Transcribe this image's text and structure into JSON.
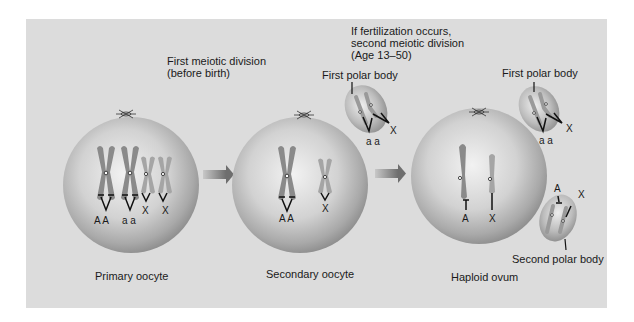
{
  "figure": {
    "panel_color": "#dcdcdc",
    "cell_color": "#c4c4c4",
    "chromosome_color": "#8a8a8a",
    "arrow_color": "#7a7a7a"
  },
  "stages": {
    "first_division": {
      "line1": "First meiotic division",
      "line2": "(before birth)"
    },
    "second_division": {
      "line1": "If fertilization occurs,",
      "line2": "second meiotic division",
      "line3": "(Age 13–50)"
    }
  },
  "cells": {
    "primary": {
      "label": "Primary oocyte",
      "alleles": [
        "A A",
        "a a",
        "X",
        "X"
      ]
    },
    "secondary": {
      "label": "Secondary oocyte",
      "alleles": [
        "A A",
        "X"
      ]
    },
    "ovum": {
      "label": "Haploid ovum",
      "alleles": [
        "A",
        "X"
      ]
    }
  },
  "polar_bodies": {
    "first_1": {
      "label": "First polar body",
      "alleles": [
        "a a",
        "X"
      ]
    },
    "first_2": {
      "label": "First polar body",
      "alleles": [
        "a a",
        "X"
      ]
    },
    "second": {
      "label": "Second polar body",
      "alleles": [
        "A",
        "X"
      ]
    }
  }
}
